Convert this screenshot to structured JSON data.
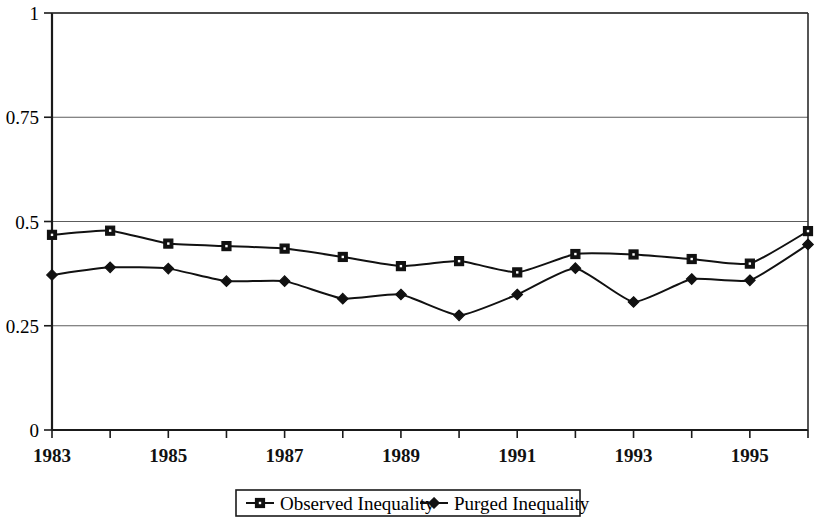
{
  "chart_data": {
    "type": "line",
    "title": "",
    "subtitle": "",
    "xlabel": "",
    "ylabel": "",
    "x": [
      1983,
      1984,
      1985,
      1986,
      1987,
      1988,
      1989,
      1990,
      1991,
      1992,
      1993,
      1994,
      1995,
      1996
    ],
    "xlim": [
      1983,
      1996
    ],
    "ylim": [
      0,
      1
    ],
    "ytick_values": [
      0,
      0.25,
      0.5,
      0.75,
      1
    ],
    "ytick_labels": [
      "0",
      "0.25",
      "0.5",
      "0.75",
      "1"
    ],
    "xtick_values": [
      1983,
      1984,
      1985,
      1986,
      1987,
      1988,
      1989,
      1990,
      1991,
      1992,
      1993,
      1994,
      1995,
      1996
    ],
    "xtick_labels": [
      "1983",
      "",
      "1985",
      "",
      "1987",
      "",
      "1989",
      "",
      "1991",
      "",
      "1993",
      "",
      "1995",
      ""
    ],
    "grid": true,
    "grid_axis": "y",
    "legend_position": "bottom",
    "series": [
      {
        "name": "Observed Inequality",
        "marker": "square",
        "color": "#111111",
        "values": [
          0.468,
          0.478,
          0.447,
          0.441,
          0.435,
          0.415,
          0.393,
          0.405,
          0.378,
          0.422,
          0.421,
          0.41,
          0.399,
          0.477
        ]
      },
      {
        "name": "Purged Inequality",
        "marker": "diamond",
        "color": "#111111",
        "values": [
          0.372,
          0.39,
          0.387,
          0.357,
          0.357,
          0.315,
          0.325,
          0.275,
          0.325,
          0.388,
          0.307,
          0.362,
          0.359,
          0.445
        ]
      }
    ]
  },
  "legend": {
    "entries": [
      {
        "label": "Observed Inequality",
        "marker": "square"
      },
      {
        "label": "Purged Inequality",
        "marker": "diamond"
      }
    ]
  },
  "axes": {
    "y_top_label": "1",
    "y_labels": [
      "1",
      "0.75",
      "0.5",
      "0.25",
      "0"
    ],
    "x_labels": [
      "1983",
      "1985",
      "1987",
      "1989",
      "1991",
      "1993",
      "1995"
    ]
  }
}
